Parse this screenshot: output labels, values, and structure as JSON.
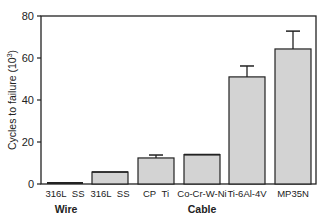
{
  "chart_data": {
    "type": "bar",
    "title": "",
    "xlabel": "",
    "ylabel": "Cycles to failure (10³)",
    "ylabel_main": "Cycles to failure (10",
    "ylabel_exp": "3",
    "ylabel_close": ")",
    "ylim": [
      0,
      80
    ],
    "yticks": [
      0,
      20,
      40,
      60,
      80
    ],
    "grid": false,
    "legend": null,
    "categories": [
      "316L  SS",
      "316L  SS",
      "CP  Ti",
      "Co-Cr-W-Ni",
      "Ti-6Al-4V",
      "MP35N"
    ],
    "groups": [
      {
        "label": "Wire",
        "categories": [
          "316L  SS"
        ]
      },
      {
        "label": "Cable",
        "categories": [
          "316L  SS",
          "CP  Ti",
          "Co-Cr-W-Ni",
          "Ti-6Al-4V",
          "MP35N"
        ]
      }
    ],
    "series": [
      {
        "name": "Cycles to failure",
        "values": [
          0.6,
          5.7,
          12.4,
          14.0,
          51.0,
          64.3
        ],
        "errors": [
          0.2,
          0.3,
          1.4,
          0.4,
          5.2,
          8.5
        ]
      }
    ],
    "bar_color": "#d3d3d3",
    "edge_color": "#222222"
  }
}
